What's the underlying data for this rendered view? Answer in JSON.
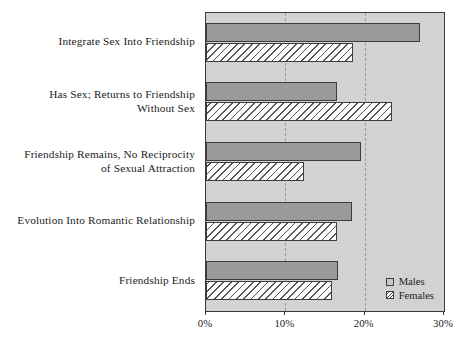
{
  "chart_data": {
    "type": "bar",
    "orientation": "horizontal",
    "title": "",
    "xlabel": "",
    "ylabel": "",
    "xlim": [
      0,
      30
    ],
    "xticks": [
      0,
      10,
      20,
      30
    ],
    "xtick_labels": [
      "0%",
      "10%",
      "20%",
      "30%"
    ],
    "grid": true,
    "grid_axis": "x",
    "legend_position": "bottom-right",
    "categories": [
      "Integrate Sex Into Friendship",
      "Has Sex; Returns to Friendship Without Sex",
      "Friendship Remains, No Reciprocity of Sexual Attraction",
      "Evolution Into Romantic Relationship",
      "Friendship Ends"
    ],
    "category_lines": [
      [
        "Integrate Sex Into Friendship"
      ],
      [
        "Has Sex; Returns to Friendship",
        "Without Sex"
      ],
      [
        "Friendship Remains, No Reciprocity",
        "of Sexual Attraction"
      ],
      [
        "Evolution Into Romantic Relationship"
      ],
      [
        "Friendship Ends"
      ]
    ],
    "series": [
      {
        "name": "Males",
        "color": "#9a9a9a",
        "values": [
          27.0,
          16.5,
          19.5,
          18.4,
          16.6
        ]
      },
      {
        "name": "Females",
        "color": "#fdfdfd",
        "values": [
          18.5,
          23.5,
          12.3,
          16.5,
          15.9
        ]
      }
    ]
  },
  "legend": {
    "items": [
      {
        "label": "Males"
      },
      {
        "label": "Females"
      }
    ]
  },
  "colors": {
    "plot_background": "#d2d2d2",
    "males_bar": "#9a9a9a",
    "females_bar": "#fdfdfd",
    "axis": "#3a3a3a",
    "gridline": "#9a9a9a"
  }
}
